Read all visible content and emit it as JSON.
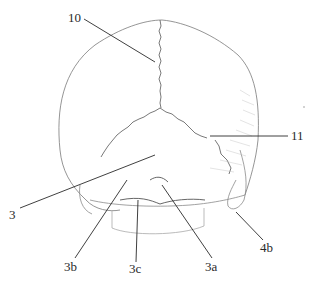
{
  "figure": {
    "labels": {
      "l10": "10",
      "l11": "11",
      "l3": "3",
      "l3b": "3b",
      "l3c": "3c",
      "l3a": "3a",
      "l4b": "4b"
    },
    "colors": {
      "stroke": "#5a5a5a",
      "leader": "#2a2a2a",
      "shade": "#9a9a9a",
      "background": "#ffffff"
    }
  }
}
